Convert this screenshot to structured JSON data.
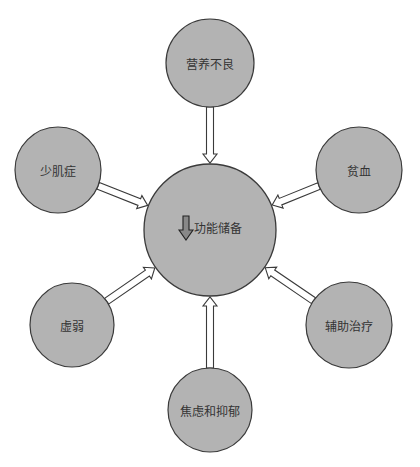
{
  "diagram": {
    "type": "hub-and-spoke",
    "colors": {
      "circle_fill": "#b3b3b3",
      "circle_stroke": "#3a3a3a",
      "arrow_stroke": "#3a3a3a",
      "arrow_fill": "#ffffff",
      "down_arrow_fill": "#888888"
    },
    "center": {
      "label": "功能储备",
      "icon": "down-arrow-icon",
      "cx": 210,
      "cy": 230,
      "r": 66
    },
    "nodes": [
      {
        "id": "malnutrition",
        "label": "营养不良",
        "cx": 210,
        "cy": 63,
        "r": 44
      },
      {
        "id": "anemia",
        "label": "贫血",
        "cx": 359,
        "cy": 170,
        "r": 43
      },
      {
        "id": "adjuvant-therapy",
        "label": "辅助治疗",
        "cx": 349,
        "cy": 325,
        "r": 43
      },
      {
        "id": "anxiety-depression",
        "label": "焦虑和抑郁",
        "cx": 210,
        "cy": 410,
        "r": 42
      },
      {
        "id": "frailty",
        "label": "虚弱",
        "cx": 72,
        "cy": 325,
        "r": 42
      },
      {
        "id": "sarcopenia",
        "label": "少肌症",
        "cx": 58,
        "cy": 170,
        "r": 43
      }
    ],
    "edges": [
      {
        "from": "malnutrition",
        "to": "center"
      },
      {
        "from": "anemia",
        "to": "center"
      },
      {
        "from": "adjuvant-therapy",
        "to": "center"
      },
      {
        "from": "anxiety-depression",
        "to": "center"
      },
      {
        "from": "frailty",
        "to": "center"
      },
      {
        "from": "sarcopenia",
        "to": "center"
      }
    ]
  }
}
